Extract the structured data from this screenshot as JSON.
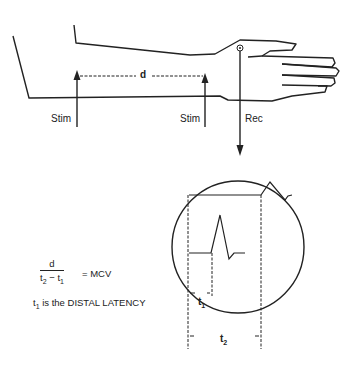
{
  "diagram": {
    "labels": {
      "distance": "d",
      "stim_proximal": "Stim",
      "stim_distal": "Stim",
      "recording": "Rec",
      "t1": "t",
      "t1_sub": "1",
      "t2": "t",
      "t2_sub": "2"
    },
    "formula": {
      "numerator": "d",
      "denominator_a": "t",
      "denominator_a_sub": "2",
      "denominator_op": " − ",
      "denominator_b": "t",
      "denominator_b_sub": "1",
      "equals": "= MCV"
    },
    "note": {
      "prefix": "t",
      "prefix_sub": "1",
      "text": " is the DISTAL LATENCY"
    },
    "colors": {
      "line": "#222222",
      "background": "#ffffff"
    }
  }
}
